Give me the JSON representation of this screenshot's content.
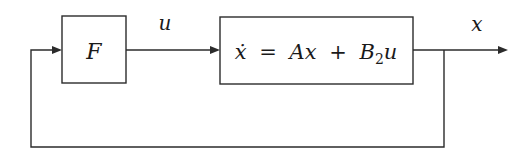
{
  "diagram": {
    "type": "block-diagram",
    "blocks": [
      {
        "id": "F",
        "label": "F"
      },
      {
        "id": "plant",
        "label_parts": {
          "lhs": "ẋ",
          "eq": "=",
          "A": "A",
          "x": "x",
          "plus": "+",
          "B": "B",
          "sub": "2",
          "u": "u"
        },
        "label": "ẋ = Ax + B₂u"
      }
    ],
    "signals": [
      {
        "from": "F",
        "to": "plant",
        "label": "u"
      },
      {
        "from": "plant",
        "to": "output",
        "label": "x"
      },
      {
        "from": "plant-output",
        "to": "F",
        "label": "",
        "kind": "feedback"
      }
    ],
    "colors": {
      "line": "#2b2b2b",
      "background": "#ffffff"
    }
  }
}
